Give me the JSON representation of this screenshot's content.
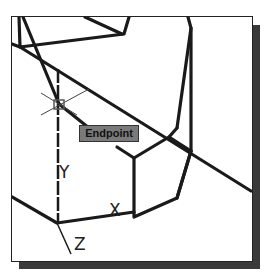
{
  "viewport": {
    "background": "#ffffff",
    "line_color": "#1a1a1a",
    "shadow_color": "#3a3a3a"
  },
  "osnap_tooltip": {
    "label": "Endpoint",
    "background": "#7a7a7a"
  },
  "ucs_icon": {
    "x_label": "X",
    "y_label": "Y",
    "z_label": "Z"
  }
}
